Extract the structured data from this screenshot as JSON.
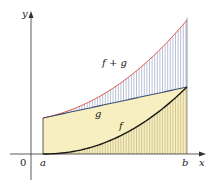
{
  "figure": {
    "type": "sum-of-functions area diagram",
    "axes": {
      "x_label": "x",
      "y_label": "y",
      "origin_label": "0",
      "interval_start_label": "a",
      "interval_end_label": "b"
    },
    "curves": [
      {
        "name": "f",
        "label": "f",
        "color": "#1a1a1a",
        "description": "convex increasing curve starting at zero at a"
      },
      {
        "name": "g",
        "label": "g",
        "color": "#3b4f7a",
        "description": "straight increasing line"
      },
      {
        "name": "f+g",
        "label": "f + g",
        "color": "#e0574f",
        "description": "sum curve, highest"
      }
    ],
    "regions": [
      {
        "name": "area-under-g",
        "fill": "#f7efc0",
        "description": "shaded region under g between a and b"
      },
      {
        "name": "area-under-f",
        "hatch": "vertical lines",
        "description": "hatched region under f"
      },
      {
        "name": "area-between-g-and-fg",
        "hatch": "vertical lines",
        "description": "hatched region between g and f+g"
      }
    ],
    "colors": {
      "fill_yellow": "#f7efc0",
      "hatch_blue": "#8d97b8",
      "hatch_olive": "#b9ad78",
      "fg_red": "#e0574f",
      "g_blue": "#3b4f7a",
      "f_black": "#1a1a1a",
      "axis": "#333333"
    }
  }
}
